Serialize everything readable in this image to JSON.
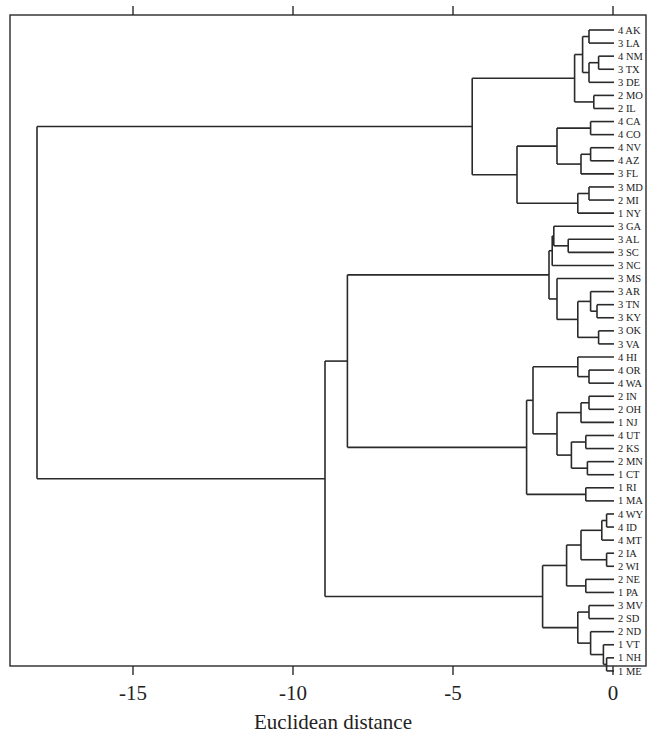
{
  "chart_data": {
    "type": "dendrogram",
    "title": "",
    "xlabel": "Euclidean distance",
    "ylabel": "",
    "xlim": [
      -18.5,
      1.0
    ],
    "x_ticks": [
      -15,
      -10,
      -5,
      0
    ],
    "x_tick_labels": [
      "-15",
      "-10",
      "-5",
      "0"
    ],
    "grid": false,
    "legend": null,
    "orientation": "leaves-right",
    "leaves": [
      "4 AK",
      "3 LA",
      "4 NM",
      "3 TX",
      "3 DE",
      "2 MO",
      "2 IL",
      "4 CA",
      "4 CO",
      "4 NV",
      "4 AZ",
      "3 FL",
      "3 MD",
      "2 MI",
      "1 NY",
      "3 GA",
      "3 AL",
      "3 SC",
      "3 NC",
      "3 MS",
      "3 AR",
      "3 TN",
      "3 KY",
      "3 OK",
      "3 VA",
      "4 HI",
      "4 OR",
      "4 WA",
      "2 IN",
      "2 OH",
      "1 NJ",
      "4 UT",
      "2 KS",
      "2 MN",
      "1 CT",
      "1 RI",
      "1 MA",
      "4 WY",
      "4 ID",
      "4 MT",
      "2 IA",
      "2 WI",
      "2 NE",
      "1 PA",
      "3 MV",
      "2 SD",
      "2 ND",
      "1 VT",
      "1 NH",
      "1 ME"
    ],
    "tree": {
      "h": -18.0,
      "c": [
        {
          "h": -4.4,
          "c": [
            {
              "h": -1.2,
              "c": [
                {
                  "h": -0.95,
                  "c": [
                    {
                      "h": -0.75,
                      "c": [
                        "4 AK",
                        "3 LA"
                      ]
                    },
                    {
                      "h": -0.75,
                      "c": [
                        {
                          "h": -0.45,
                          "c": [
                            "4 NM",
                            "3 TX"
                          ]
                        },
                        "3 DE"
                      ]
                    }
                  ]
                },
                {
                  "h": -0.6,
                  "c": [
                    "2 MO",
                    "2 IL"
                  ]
                }
              ]
            },
            {
              "h": -3.0,
              "c": [
                {
                  "h": -1.75,
                  "c": [
                    {
                      "h": -0.7,
                      "c": [
                        "4 CA",
                        "4 CO"
                      ]
                    },
                    {
                      "h": -1.0,
                      "c": [
                        {
                          "h": -0.7,
                          "c": [
                            "4 NV",
                            "4 AZ"
                          ]
                        },
                        "3 FL"
                      ]
                    }
                  ]
                },
                {
                  "h": -1.1,
                  "c": [
                    {
                      "h": -0.75,
                      "c": [
                        "3 MD",
                        "2 MI"
                      ]
                    },
                    "1 NY"
                  ]
                }
              ]
            }
          ]
        },
        {
          "h": -9.0,
          "c": [
            {
              "h": -8.3,
              "c": [
                {
                  "h": -2.0,
                  "c": [
                    {
                      "h": -1.9,
                      "c": [
                        {
                          "h": -1.85,
                          "c": [
                            "3 GA",
                            {
                              "h": -1.4,
                              "c": [
                                "3 AL",
                                "3 SC"
                              ]
                            }
                          ]
                        },
                        "3 NC"
                      ]
                    },
                    {
                      "h": -1.75,
                      "c": [
                        "3 MS",
                        {
                          "h": -1.1,
                          "c": [
                            {
                              "h": -0.7,
                              "c": [
                                "3 AR",
                                {
                                  "h": -0.5,
                                  "c": [
                                    "3 TN",
                                    "3 KY"
                                  ]
                                }
                              ]
                            },
                            {
                              "h": -0.45,
                              "c": [
                                "3 OK",
                                "3 VA"
                              ]
                            }
                          ]
                        }
                      ]
                    }
                  ]
                },
                {
                  "h": -2.7,
                  "c": [
                    {
                      "h": -2.5,
                      "c": [
                        {
                          "h": -1.1,
                          "c": [
                            "4 HI",
                            {
                              "h": -0.75,
                              "c": [
                                "4 OR",
                                "4 WA"
                              ]
                            }
                          ]
                        },
                        {
                          "h": -1.75,
                          "c": [
                            {
                              "h": -1.0,
                              "c": [
                                {
                                  "h": -0.75,
                                  "c": [
                                    "2 IN",
                                    "2 OH"
                                  ]
                                },
                                "1 NJ"
                              ]
                            },
                            {
                              "h": -1.3,
                              "c": [
                                {
                                  "h": -0.85,
                                  "c": [
                                    "4 UT",
                                    "2 KS"
                                  ]
                                },
                                {
                                  "h": -0.8,
                                  "c": [
                                    "2 MN",
                                    "1 CT"
                                  ]
                                }
                              ]
                            }
                          ]
                        }
                      ]
                    },
                    {
                      "h": -0.85,
                      "c": [
                        "1 RI",
                        "1 MA"
                      ]
                    }
                  ]
                }
              ]
            },
            {
              "h": -2.2,
              "c": [
                {
                  "h": -1.45,
                  "c": [
                    {
                      "h": -1.0,
                      "c": [
                        {
                          "h": -0.35,
                          "c": [
                            {
                              "h": -0.2,
                              "c": [
                                "4 WY",
                                "4 ID"
                              ]
                            },
                            "4 MT"
                          ]
                        },
                        {
                          "h": -0.2,
                          "c": [
                            "2 IA",
                            "2 WI"
                          ]
                        }
                      ]
                    },
                    {
                      "h": -0.85,
                      "c": [
                        "2 NE",
                        "1 PA"
                      ]
                    }
                  ]
                },
                {
                  "h": -1.1,
                  "c": [
                    {
                      "h": -0.75,
                      "c": [
                        "3 MV",
                        "2 SD"
                      ]
                    },
                    {
                      "h": -0.7,
                      "c": [
                        "2 ND",
                        {
                          "h": -0.3,
                          "c": [
                            "1 VT",
                            {
                              "h": -0.2,
                              "c": [
                                "1 NH",
                                "1 ME"
                              ]
                            }
                          ]
                        }
                      ]
                    }
                  ]
                }
              ]
            }
          ]
        }
      ]
    }
  },
  "axis": {
    "xlabel": "Euclidean distance",
    "tick_labels": [
      "-15",
      "-10",
      "-5",
      "0"
    ]
  },
  "colors": {
    "line": "#2a2a2a",
    "text": "#222222",
    "background": "#ffffff"
  }
}
